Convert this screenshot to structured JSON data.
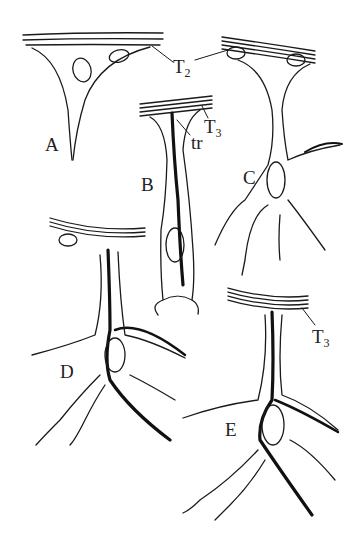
{
  "figure": {
    "panels": [
      {
        "id": "A",
        "label": "A"
      },
      {
        "id": "B",
        "label": "B"
      },
      {
        "id": "C",
        "label": "C"
      },
      {
        "id": "D",
        "label": "D"
      },
      {
        "id": "E",
        "label": "E"
      }
    ],
    "annotations": {
      "t2": {
        "main": "T",
        "sub": "2"
      },
      "t3_b": {
        "main": "T",
        "sub": "3"
      },
      "tr": {
        "main": "tr"
      },
      "t3_e": {
        "main": "T",
        "sub": "3"
      }
    },
    "colors": {
      "ink": "#1a1a1a",
      "background": "#ffffff"
    }
  }
}
